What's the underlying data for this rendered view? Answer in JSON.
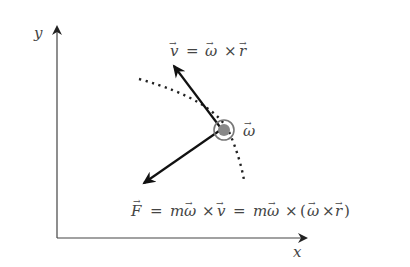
{
  "diagram": {
    "axes": {
      "x_label": "x",
      "y_label": "y"
    },
    "labels": {
      "velocity": {
        "lhs": "v",
        "eq": "=",
        "a": "ω",
        "op": "×",
        "b": "r"
      },
      "omega": "ω",
      "force": {
        "lhs": "F",
        "eq1": "=",
        "m1": "m",
        "w1": "ω",
        "op1": "×",
        "v": "v",
        "eq2": "=",
        "m2": "m",
        "w2": "ω",
        "op2": "×",
        "lp": "(",
        "w3": "ω",
        "op3": "×",
        "r": "r",
        "rp": ")"
      }
    },
    "colors": {
      "axis": "#444444",
      "vector": "#111111",
      "text": "#444444",
      "particle_fill": "#888888",
      "particle_ring": "#777777"
    }
  }
}
